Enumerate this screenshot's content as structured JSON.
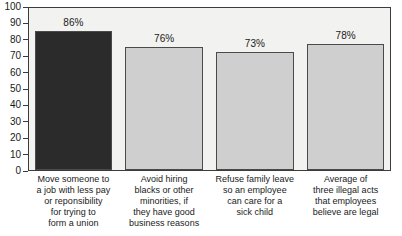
{
  "chart_data": {
    "type": "bar",
    "title": "",
    "xlabel": "",
    "ylabel": "",
    "ylim": [
      0,
      100
    ],
    "grid": false,
    "legend": "none",
    "y_ticks": [
      100,
      90,
      80,
      70,
      60,
      50,
      40,
      30,
      20,
      10,
      0
    ],
    "categories": [
      "Move someone to a job with less pay or reponsibility for trying to form a union",
      "Avoid hiring blacks or other minorities, if they have good business reasons",
      "Refuse family leave so an employee can care for a sick child",
      "Average of three illegal acts that employees believe are legal"
    ],
    "category_lines": [
      [
        "Move someone to",
        "a job with less pay",
        "or reponsibility",
        "for trying to",
        "form a union"
      ],
      [
        "Avoid hiring",
        "blacks or other",
        "minorities, if",
        "they have good",
        "business reasons"
      ],
      [
        "Refuse family leave",
        "so an employee",
        "can care for a",
        "sick child"
      ],
      [
        "Average of",
        "three illegal acts",
        "that employees",
        "believe are legal"
      ]
    ],
    "values": [
      86,
      76,
      73,
      78
    ],
    "value_labels": [
      "86%",
      "76%",
      "73%",
      "78%"
    ],
    "bar_colors": [
      "#2b2b2b",
      "#cfcfcf",
      "#cfcfcf",
      "#cfcfcf"
    ],
    "bar_border_color": "#4a4a4a",
    "plot_background": "#f2f2f0",
    "axis_color": "#3c3c3c",
    "text_color": "#1a1a1a"
  }
}
